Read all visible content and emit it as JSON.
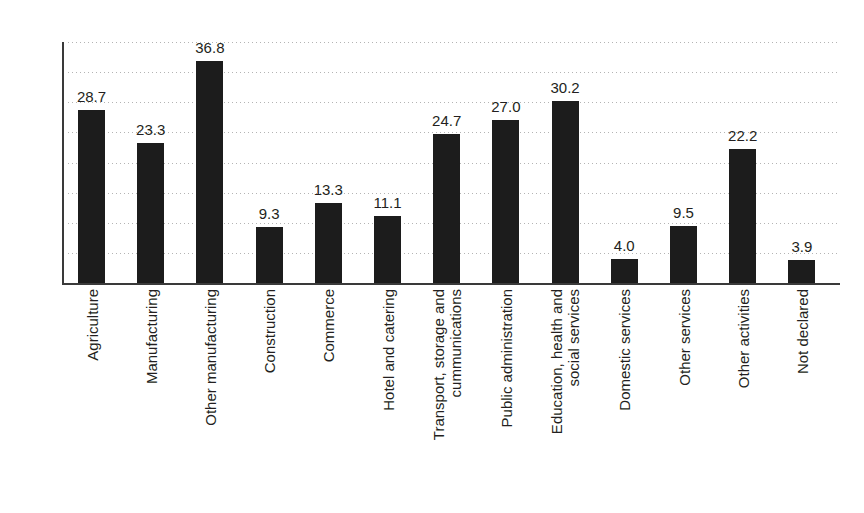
{
  "chart_data": {
    "type": "bar",
    "title": "",
    "subtitle": "",
    "xlabel": "",
    "ylabel": "",
    "ylim": [
      0,
      40
    ],
    "ytick_step": 5,
    "yticks": [
      40,
      35,
      30,
      25,
      20,
      15,
      10,
      5,
      0
    ],
    "grid": true,
    "grid_style": "dotted-horizontal",
    "legend": "none",
    "bar_color": "#1c1c1c",
    "axis_color": "#3a3a3a",
    "gridline_color": "#b4b4b4",
    "text_color": "#231f20",
    "data_labels": true,
    "categories": [
      "Agriculture",
      "Manufacturing",
      "Other manufacturing",
      "Construction",
      "Commerce",
      "Hotel and catering",
      "Transport, storage and\ncummunications",
      "Public administration",
      "Education, health and\nsocial services",
      "Domestic services",
      "Other services",
      "Other activities",
      "Not declared"
    ],
    "values": [
      28.7,
      23.3,
      36.8,
      9.3,
      13.3,
      11.1,
      24.7,
      27.0,
      30.2,
      4.0,
      9.5,
      22.2,
      3.9
    ],
    "value_labels": [
      "28.7",
      "23.3",
      "36.8",
      "9.3",
      "13.3",
      "11.1",
      "24.7",
      "27.0",
      "30.2",
      "4.0",
      "9.5",
      "22.2",
      "3.9"
    ]
  }
}
